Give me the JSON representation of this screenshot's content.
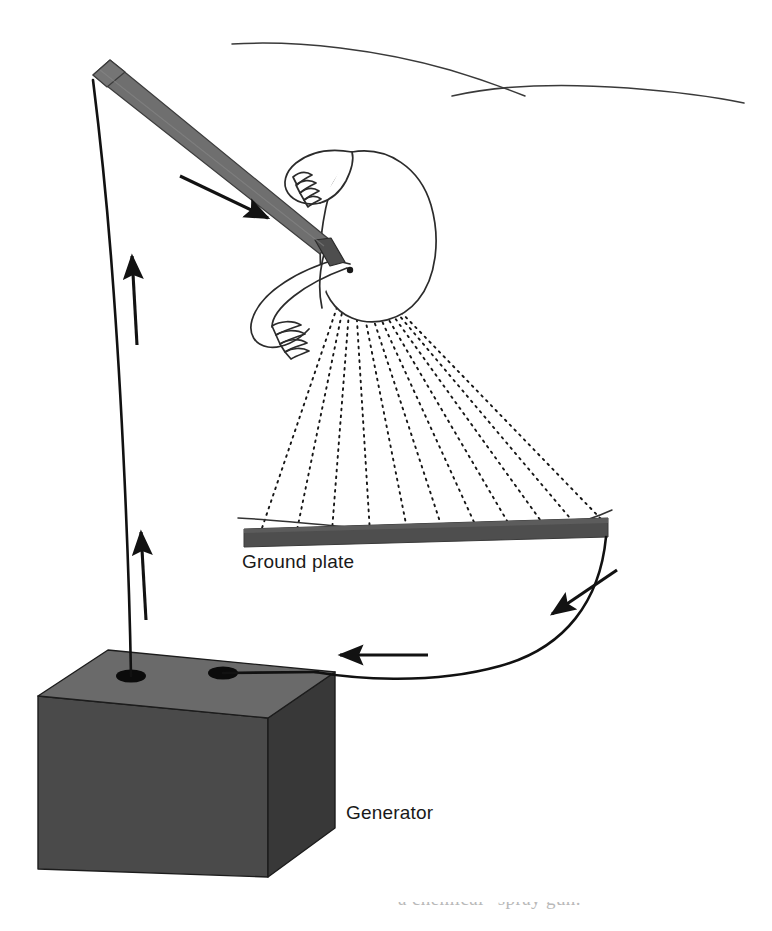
{
  "figure": {
    "type": "technical-line-diagram",
    "width": 772,
    "height": 931,
    "background_color": "#ffffff"
  },
  "labels": {
    "ground_plate": "Ground plate",
    "generator": "Generator",
    "caption_fragment": "a chemical “spray gun.”"
  },
  "colors": {
    "ink": "#141414",
    "lance_gray": "#6f6f6f",
    "lance_edge": "#3c3c3c",
    "plate_gray": "#4e4e4e",
    "box_top": "#6a6a6a",
    "box_front": "#4a4a4a",
    "box_side": "#383838",
    "box_edge": "#1c1c1c",
    "terminal_black": "#0b0b0b",
    "outline_thin": "#2b2b2b",
    "horizon_line": "#3a3a3a",
    "caption_faint": "#b9b9b9"
  },
  "components": {
    "spray_lance": {
      "name": "spray-gun-lance",
      "description": "Gray tapered lance held at an angle pointing down-right",
      "start": [
        96,
        82
      ],
      "end": [
        320,
        252
      ],
      "arrow_label": "flow-direction-down-right"
    },
    "operator": {
      "name": "operator-figure",
      "description": "Outline of a person's torso, arms and hands gripping the spray gun"
    },
    "spray_fan": {
      "name": "spray-pattern",
      "description": "Fan of dotted charged-particle trajectories from the nozzle to the ground plate",
      "origin": [
        349,
        272
      ],
      "ray_count": 11,
      "style": "dotted"
    },
    "ground_plate": {
      "name": "ground-plate",
      "left": 242,
      "right": 607,
      "top": 531,
      "thickness": 13
    },
    "generator_box": {
      "name": "generator-box",
      "terminals": 2,
      "terminal_names": [
        "high-voltage-terminal",
        "ground-return-terminal"
      ]
    },
    "cables": [
      {
        "name": "high-voltage-cable",
        "from": "generator high-voltage terminal",
        "to": "spray lance rear end",
        "arrows": 2,
        "arrow_direction": "up"
      },
      {
        "name": "ground-return-cable",
        "from": "ground plate right edge",
        "to": "generator ground terminal",
        "arrows": 2,
        "arrow_direction": "toward-generator"
      }
    ],
    "background_contours": {
      "name": "background-horizon-lines",
      "count": 2,
      "description": "Two faint sweeping contour lines suggesting a wall or horizon behind the scene"
    }
  }
}
